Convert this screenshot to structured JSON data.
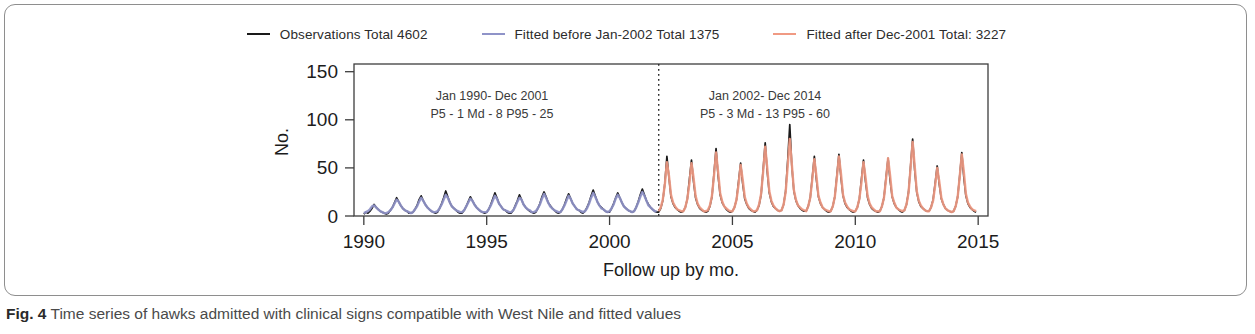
{
  "caption": {
    "figure_number": "Fig. 4",
    "text": "Time series of hawks admitted with clinical signs compatible with West Nile and fitted values"
  },
  "legend": {
    "position": "top-center",
    "entries": [
      {
        "label": "Observations  Total 4602",
        "color": "#1a1a1a",
        "name": "observations"
      },
      {
        "label": "Fitted before Jan-2002  Total 1375",
        "color": "#8f93c8",
        "name": "fitted-before"
      },
      {
        "label": "Fitted after Dec-2001  Total: 3227",
        "color": "#f09a83",
        "name": "fitted-after"
      }
    ]
  },
  "annotations": [
    {
      "line1": "Jan 1990- Dec 2001",
      "line2": "P5 - 1   Md - 8   P95 - 25"
    },
    {
      "line1": "Jan 2002- Dec 2014",
      "line2": "P5 - 3   Md - 13   P95 - 60"
    }
  ],
  "chart_data": {
    "type": "line",
    "title": "",
    "xlabel": "Follow up by mo.",
    "ylabel": "No.",
    "xlim": [
      1989.6,
      2015.4
    ],
    "ylim": [
      0,
      158
    ],
    "xticks": [
      1990,
      1995,
      2000,
      2005,
      2010,
      2015
    ],
    "yticks": [
      0,
      50,
      100,
      150
    ],
    "grid": false,
    "breakpoint_x": 2002.0,
    "breakpoint_label": "Jan-2002",
    "totals": {
      "observations": 4602,
      "fitted_before_jan2002": 1375,
      "fitted_after_dec2001": 3227
    },
    "summary_stats": {
      "Jan 1990- Dec 2001": {
        "P5": 1,
        "Md": 8,
        "P95": 25
      },
      "Jan 2002- Dec 2014": {
        "P5": 3,
        "Md": 13,
        "P95": 60
      }
    },
    "x_start": 1990.0,
    "x_step": 0.0833333,
    "series": [
      {
        "name": "Observations",
        "color": "#1a1a1a",
        "values": [
          2,
          4,
          3,
          5,
          8,
          12,
          9,
          7,
          5,
          4,
          3,
          2,
          3,
          6,
          9,
          14,
          19,
          15,
          11,
          8,
          6,
          5,
          3,
          3,
          4,
          7,
          11,
          17,
          21,
          16,
          12,
          9,
          7,
          5,
          4,
          3,
          4,
          8,
          13,
          19,
          26,
          20,
          14,
          10,
          8,
          6,
          4,
          3,
          3,
          6,
          10,
          15,
          20,
          16,
          12,
          9,
          7,
          5,
          4,
          3,
          4,
          7,
          12,
          18,
          24,
          19,
          13,
          10,
          7,
          6,
          4,
          3,
          3,
          6,
          11,
          16,
          22,
          17,
          12,
          9,
          7,
          5,
          4,
          3,
          4,
          8,
          13,
          20,
          25,
          20,
          14,
          11,
          8,
          6,
          4,
          3,
          4,
          7,
          12,
          18,
          23,
          18,
          13,
          10,
          7,
          6,
          4,
          3,
          5,
          9,
          14,
          21,
          27,
          21,
          15,
          11,
          9,
          7,
          5,
          4,
          4,
          8,
          13,
          19,
          24,
          19,
          14,
          10,
          8,
          6,
          5,
          4,
          5,
          9,
          15,
          22,
          28,
          22,
          16,
          12,
          9,
          7,
          5,
          4,
          4,
          8,
          16,
          34,
          62,
          40,
          20,
          13,
          9,
          7,
          5,
          4,
          5,
          9,
          18,
          38,
          58,
          36,
          19,
          12,
          8,
          6,
          5,
          4,
          5,
          10,
          20,
          44,
          70,
          42,
          22,
          14,
          10,
          7,
          5,
          4,
          5,
          9,
          17,
          36,
          55,
          34,
          18,
          12,
          8,
          6,
          5,
          4,
          6,
          11,
          22,
          48,
          76,
          46,
          24,
          15,
          10,
          8,
          6,
          5,
          6,
          12,
          26,
          58,
          95,
          52,
          26,
          16,
          11,
          8,
          6,
          5,
          5,
          10,
          19,
          40,
          62,
          38,
          20,
          13,
          9,
          7,
          5,
          4,
          5,
          10,
          20,
          42,
          64,
          40,
          21,
          13,
          9,
          7,
          5,
          4,
          5,
          9,
          18,
          38,
          58,
          36,
          19,
          12,
          8,
          6,
          5,
          4,
          5,
          10,
          19,
          40,
          60,
          37,
          20,
          13,
          9,
          7,
          5,
          4,
          6,
          12,
          25,
          52,
          80,
          48,
          25,
          15,
          10,
          8,
          6,
          5,
          5,
          9,
          17,
          34,
          52,
          33,
          18,
          12,
          8,
          6,
          5,
          4,
          5,
          10,
          20,
          42,
          66,
          40,
          21,
          13,
          9,
          7,
          5,
          4
        ]
      },
      {
        "name": "Fitted before Jan-2002",
        "color": "#8f93c8",
        "segment": "pre",
        "values": [
          3,
          4,
          5,
          7,
          10,
          11,
          9,
          7,
          5,
          4,
          3,
          3,
          4,
          6,
          9,
          13,
          17,
          15,
          11,
          8,
          6,
          5,
          4,
          3,
          4,
          7,
          10,
          15,
          19,
          16,
          12,
          9,
          7,
          5,
          4,
          4,
          5,
          8,
          12,
          17,
          22,
          19,
          14,
          10,
          8,
          6,
          5,
          4,
          4,
          6,
          10,
          14,
          18,
          16,
          12,
          9,
          7,
          5,
          4,
          4,
          4,
          7,
          11,
          16,
          21,
          18,
          13,
          10,
          7,
          6,
          5,
          4,
          4,
          6,
          10,
          15,
          19,
          17,
          12,
          9,
          7,
          6,
          4,
          4,
          5,
          8,
          12,
          18,
          23,
          19,
          14,
          10,
          8,
          6,
          5,
          4,
          4,
          7,
          11,
          16,
          21,
          18,
          13,
          10,
          7,
          6,
          5,
          4,
          5,
          8,
          13,
          19,
          24,
          20,
          15,
          11,
          8,
          7,
          5,
          4,
          5,
          8,
          12,
          18,
          22,
          19,
          14,
          10,
          8,
          6,
          5,
          4,
          5,
          9,
          14,
          20,
          25,
          21,
          16,
          11,
          9,
          7,
          5,
          5
        ]
      },
      {
        "name": "Fitted after Dec-2001",
        "color": "#f09a83",
        "segment": "post",
        "values": [
          5,
          9,
          17,
          33,
          56,
          42,
          22,
          14,
          10,
          7,
          6,
          5,
          5,
          9,
          18,
          34,
          55,
          40,
          21,
          13,
          9,
          7,
          5,
          5,
          6,
          11,
          21,
          42,
          66,
          46,
          24,
          15,
          10,
          8,
          6,
          5,
          5,
          9,
          17,
          33,
          53,
          38,
          20,
          13,
          9,
          7,
          5,
          5,
          6,
          12,
          23,
          46,
          72,
          50,
          26,
          16,
          11,
          8,
          6,
          5,
          6,
          12,
          25,
          52,
          80,
          54,
          27,
          17,
          11,
          9,
          7,
          6,
          5,
          10,
          19,
          38,
          59,
          42,
          21,
          14,
          9,
          7,
          6,
          5,
          5,
          10,
          20,
          40,
          62,
          44,
          22,
          14,
          10,
          7,
          6,
          5,
          5,
          9,
          18,
          35,
          56,
          40,
          21,
          13,
          9,
          7,
          5,
          5,
          5,
          10,
          19,
          38,
          60,
          42,
          21,
          14,
          9,
          7,
          6,
          5,
          6,
          12,
          24,
          50,
          77,
          52,
          26,
          16,
          11,
          8,
          6,
          5,
          5,
          9,
          16,
          32,
          50,
          36,
          19,
          12,
          8,
          6,
          5,
          4,
          5,
          10,
          20,
          41,
          64,
          46,
          23,
          14,
          10,
          7,
          6,
          5
        ]
      }
    ]
  }
}
